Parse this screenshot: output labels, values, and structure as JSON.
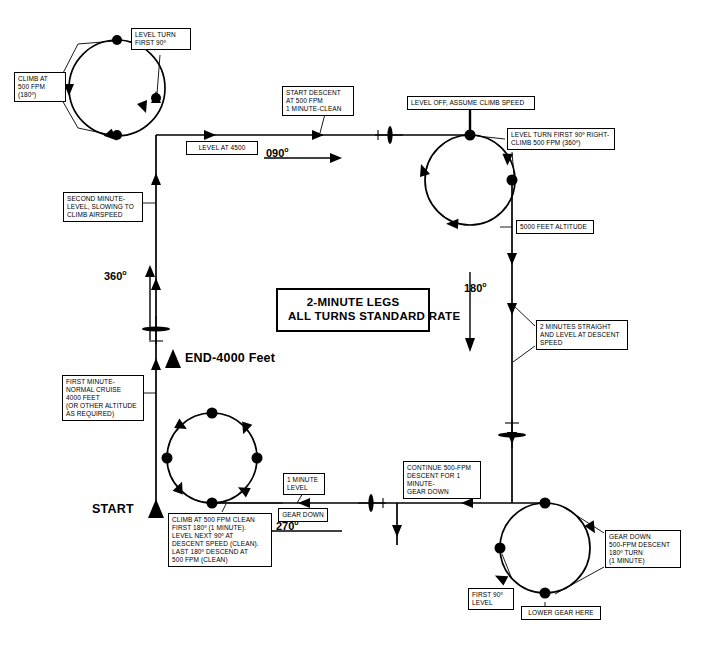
{
  "diagram": {
    "title_line1": "2-MINUTE LEGS",
    "title_line2": "ALL TURNS STANDARD RATE",
    "start_label": "START",
    "end_label": "END-4000 Feet"
  },
  "headings": [
    {
      "name": "heading-090",
      "text": "090",
      "degree": "o"
    },
    {
      "name": "heading-180",
      "text": "180",
      "degree": "o"
    },
    {
      "name": "heading-270",
      "text": "270",
      "degree": "o"
    },
    {
      "name": "heading-360",
      "text": "360",
      "degree": "o"
    }
  ],
  "callouts": {
    "climb_500_180": "CLIMB AT\n500 FPM\n(180º)",
    "level_turn_first_90": "LEVEL TURN\nFIRST 90º",
    "second_minute": "SECOND MINUTE-\nLEVEL, SLOWING TO\nCLIMB AIRSPEED",
    "first_minute": "FIRST MINUTE-\nNORMAL CRUISE\n4000 FEET\n(OR OTHER ALTITUDE\nAS REQUIRED)",
    "level_at_4500": "LEVEL AT 4500",
    "start_descent": "START DESCENT\nAT 500 FPM\n1 MINUTE-CLEAN",
    "level_off_climb_speed": "LEVEL OFF, ASSUME CLIMB SPEED",
    "level_turn_first_90_right": "LEVEL TURN FIRST 90º RIGHT-\nCLIMB 500 FPM (360º)",
    "altitude_5000": "5000 FEET ALTITUDE",
    "two_minutes_straight": "2 MINUTES STRAIGHT\nAND LEVEL AT DESCENT\nSPEED",
    "continue_descent": "CONTINUE 500-FPM\nDESCENT FOR 1\nMINUTE-\nGEAR DOWN",
    "gear_down_right": "GEAR DOWN\n500-FPM DESCENT\n180º TURN\n(1 MINUTE)",
    "first_90_level": "FIRST 90º\nLEVEL",
    "lower_gear_here": "LOWER GEAR HERE",
    "one_minute_level": "1 MINUTE\nLEVEL",
    "gear_down_left": "GEAR DOWN",
    "climb_clean_sequence": "CLIMB AT 500 FPM CLEAN\nFIRST 180º (1 MINUTE).\nLEVEL NEXT 90º AT\nDESCENT SPEED (CLEAN).\nLAST 180º DESCEND AT\n500 FPM (CLEAN)"
  },
  "colors": {
    "ink": "#000000",
    "paper": "#ffffff"
  }
}
